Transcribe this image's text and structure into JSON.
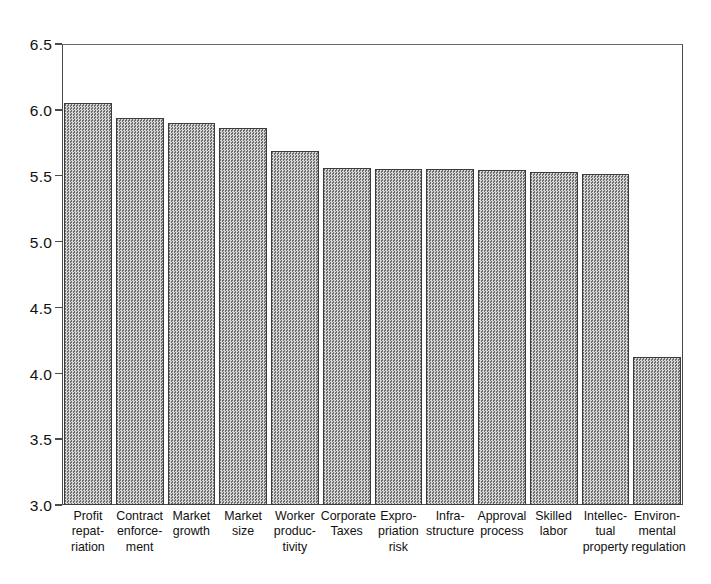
{
  "chart_data": {
    "type": "bar",
    "title": "",
    "subtitle": "",
    "xlabel": "",
    "ylabel": "",
    "ylim": [
      3.0,
      6.5
    ],
    "yticks": [
      "3.0",
      "3.5",
      "4.0",
      "4.5",
      "5.0",
      "5.5",
      "6.0",
      "6.5"
    ],
    "ytick_values": [
      3.0,
      3.5,
      4.0,
      4.5,
      5.0,
      5.5,
      6.0,
      6.5
    ],
    "grid": false,
    "legend": "none",
    "bar_fill": "#9a9a9a",
    "bar_edge": "#3c3c3c",
    "axis_color": "#4a4a4a",
    "categories": [
      "Profit repatriation",
      "Contract enforcement",
      "Market growth",
      "Market size",
      "Worker productivity",
      "Corporate Taxes",
      "Expropriation risk",
      "Infrastructure",
      "Approval process",
      "Skilled labor",
      "Intellectual property",
      "Environmental regulation"
    ],
    "category_lines": [
      [
        "Profit",
        "repat-",
        "riation"
      ],
      [
        "Contract",
        "enforce-",
        "ment"
      ],
      [
        "Market",
        "growth"
      ],
      [
        "Market",
        "size"
      ],
      [
        "Worker",
        "produc-",
        "tivity"
      ],
      [
        "Corporate",
        "Taxes"
      ],
      [
        "Expro-",
        "priation",
        "risk"
      ],
      [
        "Infra-",
        "structure"
      ],
      [
        "Approval",
        "process"
      ],
      [
        "Skilled",
        "labor"
      ],
      [
        "Intellec-",
        "tual",
        "property"
      ],
      [
        "Environ-",
        "mental",
        "regulation"
      ]
    ],
    "values": [
      6.05,
      5.94,
      5.9,
      5.86,
      5.69,
      5.56,
      5.55,
      5.55,
      5.54,
      5.53,
      5.51,
      4.12
    ]
  },
  "caption": {
    "text": ""
  }
}
